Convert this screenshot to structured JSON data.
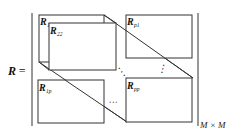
{
  "diagram": {
    "lhs_symbol": "R",
    "equals": "=",
    "dimension_label": "M × M",
    "blocks": [
      {
        "id": "R11",
        "base": "R",
        "sub": "11"
      },
      {
        "id": "R22",
        "base": "R",
        "sub": "22"
      },
      {
        "id": "Rp1",
        "base": "R",
        "sub": "p1"
      },
      {
        "id": "R1p",
        "base": "R",
        "sub": "1p"
      },
      {
        "id": "Rpp",
        "base": "R",
        "sub": "pp"
      }
    ],
    "ellipses": {
      "vertical": "⋮",
      "horizontal": "⋯",
      "diagonal": "⋱"
    },
    "colors": {
      "line": "#333333",
      "background": "#ffffff"
    }
  }
}
